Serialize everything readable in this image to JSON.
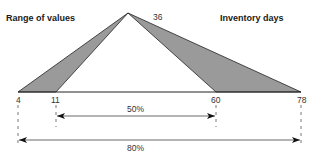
{
  "diagram": {
    "left_title": "Range of values",
    "right_title": "Inventory days",
    "apex_label": "36",
    "points": [
      {
        "label": "4",
        "x": 18
      },
      {
        "label": "11",
        "x": 56
      },
      {
        "label": "60",
        "x": 216
      },
      {
        "label": "78",
        "x": 301
      }
    ],
    "ranges": [
      {
        "label": "50%",
        "from": "11",
        "to": "60"
      },
      {
        "label": "80%",
        "from": "4",
        "to": "78"
      }
    ],
    "colors": {
      "fill": "#9a9a9a",
      "stroke": "#222222",
      "text": "#333333"
    }
  }
}
